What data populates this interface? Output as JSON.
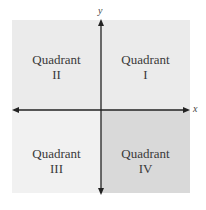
{
  "diagram": {
    "title": "",
    "axes": {
      "x_label": "x",
      "y_label": "y"
    },
    "quadrants": [
      {
        "id": "II",
        "label": "Quadrant",
        "numeral": "II",
        "position": "top-left",
        "color": "#ebebeb"
      },
      {
        "id": "I",
        "label": "Quadrant",
        "numeral": "I",
        "position": "top-right",
        "color": "#ebebeb"
      },
      {
        "id": "III",
        "label": "Quadrant",
        "numeral": "III",
        "position": "bottom-left",
        "color": "#f1f1f1"
      },
      {
        "id": "IV",
        "label": "Quadrant",
        "numeral": "IV",
        "position": "bottom-right",
        "color": "#d9d9d9"
      }
    ],
    "axis_color": "#222222"
  }
}
